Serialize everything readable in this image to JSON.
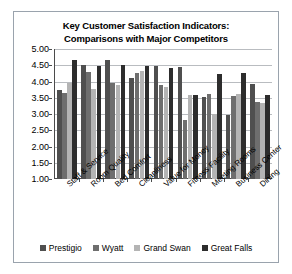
{
  "chart_data": {
    "type": "bar",
    "title": "Key Customer Satisfaction Indicators: Comparisons with Major Competitors",
    "title_line1": "Key Customer Satisfaction Indicators:",
    "title_line2": "Comparisons with Major Competitors",
    "xlabel": "",
    "ylabel": "",
    "ylim": [
      1.0,
      5.0
    ],
    "ytick_step": 0.5,
    "ytick_labels": [
      "5.00",
      "4.50",
      "4.00",
      "3.50",
      "3.00",
      "2.50",
      "2.00",
      "1.50",
      "1.00"
    ],
    "ytick_values": [
      5.0,
      4.5,
      4.0,
      3.5,
      3.0,
      2.5,
      2.0,
      1.5,
      1.0
    ],
    "grid": true,
    "legend_position": "bottom",
    "categories": [
      "Staff & Service",
      "Room Quality",
      "Bed Comfort",
      "Cleanliness",
      "Value for Money",
      "Fitness Facility",
      "Meeting Rooms",
      "Business Center",
      "Dining"
    ],
    "series": [
      {
        "name": "Prestigio",
        "color": "#4f4f4f",
        "values": [
          3.75,
          4.5,
          4.65,
          4.1,
          4.48,
          4.45,
          3.52,
          2.98,
          3.92
        ]
      },
      {
        "name": "Wyatt",
        "color": "#6e6e6e",
        "values": [
          3.65,
          4.3,
          3.95,
          4.25,
          3.88,
          2.82,
          3.62,
          3.55,
          3.38
        ]
      },
      {
        "name": "Grand Swan",
        "color": "#b4b4b4",
        "values": [
          3.95,
          3.78,
          3.88,
          4.32,
          3.82,
          3.6,
          3.0,
          3.62,
          3.35
        ]
      },
      {
        "name": "Great Falls",
        "color": "#2d2d2d",
        "values": [
          4.65,
          4.48,
          4.52,
          4.48,
          4.42,
          3.58,
          4.22,
          4.25,
          3.6
        ]
      }
    ]
  },
  "legend": {
    "items": [
      {
        "label": "Prestigio"
      },
      {
        "label": "Wyatt"
      },
      {
        "label": "Grand Swan"
      },
      {
        "label": "Great Falls"
      }
    ]
  }
}
